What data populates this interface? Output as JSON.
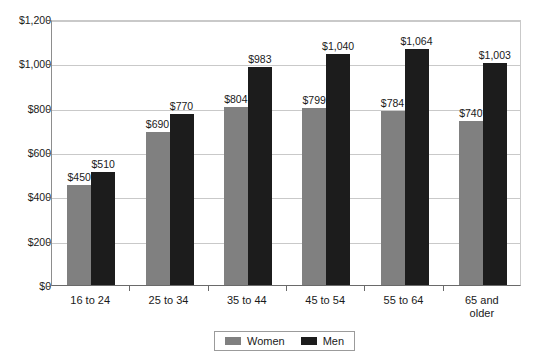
{
  "chart_data": {
    "type": "bar",
    "title": "",
    "subtitle": "",
    "xlabel": "",
    "ylabel": "",
    "ylim": [
      0,
      1200
    ],
    "ytick_step": 200,
    "grid": true,
    "legend_position": "bottom",
    "categories": [
      "16 to 24",
      "25 to 34",
      "35 to 44",
      "45 to 54",
      "55 to 64",
      "65 and older"
    ],
    "category_lines": [
      [
        "16 to 24"
      ],
      [
        "25 to 34"
      ],
      [
        "35 to 44"
      ],
      [
        "45 to 54"
      ],
      [
        "55 to 64"
      ],
      [
        "65 and",
        "older"
      ]
    ],
    "ytick_labels": [
      "$0",
      "$200",
      "$400",
      "$600",
      "$800",
      "$1,000",
      "$1,200"
    ],
    "ytick_values": [
      0,
      200,
      400,
      600,
      800,
      1000,
      1200
    ],
    "series": [
      {
        "name": "Women",
        "color": "#808080",
        "values": [
          450,
          690,
          804,
          799,
          784,
          740
        ],
        "data_labels": [
          "$450",
          "$690",
          "$804",
          "$799",
          "$784",
          "$740"
        ]
      },
      {
        "name": "Men",
        "color": "#1c1c1c",
        "values": [
          510,
          770,
          983,
          1040,
          1064,
          1003
        ],
        "data_labels": [
          "$510",
          "$770",
          "$983",
          "$1,040",
          "$1,064",
          "$1,003"
        ]
      }
    ]
  },
  "legend": {
    "items": [
      {
        "label": "Women",
        "color": "#808080"
      },
      {
        "label": "Men",
        "color": "#1c1c1c"
      }
    ]
  }
}
